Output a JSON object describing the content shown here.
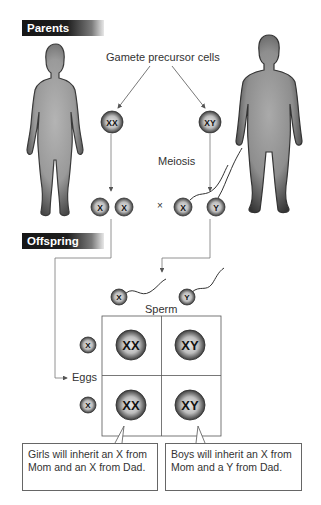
{
  "sections": {
    "parents_title": "Parents",
    "offspring_title": "Offspring"
  },
  "labels": {
    "gamete_precursor": "Gamete precursor cells",
    "meiosis": "Meiosis",
    "cross_symbol": "×",
    "sperm": "Sperm",
    "eggs": "Eggs"
  },
  "parents": {
    "mother": {
      "figure": "female-silhouette",
      "precursor_cell": "XX",
      "gametes": [
        "X",
        "X"
      ]
    },
    "father": {
      "figure": "male-silhouette",
      "precursor_cell": "XY",
      "gametes": [
        "X",
        "Y"
      ]
    }
  },
  "punnett_square": {
    "sperm_alleles": [
      "X",
      "Y"
    ],
    "egg_alleles": [
      "X",
      "X"
    ],
    "cells": [
      [
        "XX",
        "XY"
      ],
      [
        "XX",
        "XY"
      ]
    ]
  },
  "callouts": {
    "girls": "Girls will inherit an X from Mom and an X from Dad.",
    "boys": "Boys will inherit an X from Mom and a Y from Dad."
  },
  "colors": {
    "banner_dark": "#161616",
    "silhouette_dark": "#3a3a3a",
    "silhouette_light": "#a8a8a8",
    "cell_fill": "#9a9a9a",
    "line": "#777777"
  }
}
